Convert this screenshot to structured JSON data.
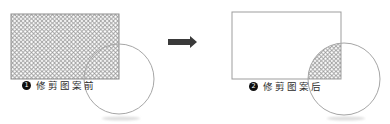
{
  "diagram": {
    "before": {
      "badge": "1",
      "label": "修剪图案前"
    },
    "after": {
      "badge": "2",
      "label": "修剪图案后"
    }
  },
  "icons": {
    "arrow": "right-arrow"
  },
  "colors": {
    "background": "#ffffff",
    "hatch_line": "#9b9b9b",
    "rect_stroke_before": "#8e8e8e",
    "rect_stroke_after": "#9d9d9d",
    "circle_stroke": "#a6a6a6",
    "arrow": "#3a3a3a",
    "badge_bg": "#101010",
    "badge_text": "#ffffff",
    "label_text": "#2b2b2b",
    "shadow": "#dedede"
  }
}
